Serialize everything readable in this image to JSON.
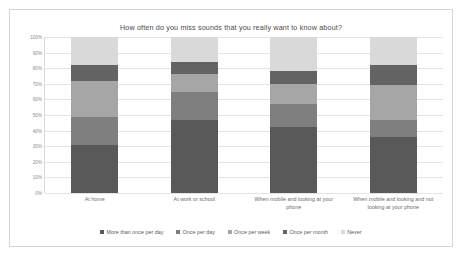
{
  "chart_data": {
    "type": "bar",
    "subtype": "stacked-100-percent",
    "title": "How often do you miss sounds that you really want to know about?",
    "xlabel": "",
    "ylabel": "",
    "ylim": [
      0,
      100
    ],
    "ytick_labels": [
      "100%",
      "90%",
      "80%",
      "70%",
      "60%",
      "50%",
      "40%",
      "30%",
      "20%",
      "10%",
      "0%"
    ],
    "ytick_values": [
      100,
      90,
      80,
      70,
      60,
      50,
      40,
      30,
      20,
      10,
      0
    ],
    "grid": true,
    "legend_position": "bottom",
    "categories": [
      "At home",
      "At work or school",
      "When mobile and looking at your phone",
      "When mobile and looking and not looking at your phone"
    ],
    "series": [
      {
        "name": "More than once per day",
        "color": "#595959",
        "values": [
          31,
          47,
          42,
          36
        ]
      },
      {
        "name": "Once per day",
        "color": "#7f7f7f",
        "values": [
          18,
          18,
          15,
          11
        ]
      },
      {
        "name": "Once per week",
        "color": "#a6a6a6",
        "values": [
          23,
          11,
          13,
          22
        ]
      },
      {
        "name": "Once per month",
        "color": "#636363",
        "values": [
          10,
          8,
          8,
          13
        ]
      },
      {
        "name": "Never",
        "color": "#d9d9d9",
        "values": [
          18,
          16,
          22,
          18
        ]
      }
    ]
  },
  "colors": {
    "frame_border": "#d6d6d6",
    "gridline": "#e4e4e4",
    "title_text": "#4a4a4a",
    "axis_text": "#8a8a8a",
    "category_text": "#6b6b6b",
    "legend_text": "#5d5d5d",
    "background": "#ffffff"
  }
}
